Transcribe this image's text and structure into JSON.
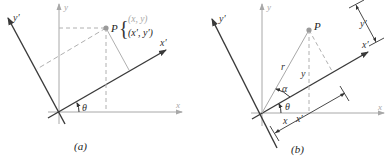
{
  "figure_a": {
    "caption": "(a)",
    "axis_x": "x",
    "axis_y": "y",
    "axis_x_prime": "x′",
    "axis_y_prime": "y′",
    "angle": "θ",
    "point": "P",
    "coord_xy": "(x, y)",
    "coord_xy_prime": "(x′, y′)"
  },
  "figure_b": {
    "caption": "(b)",
    "axis_x": "x",
    "axis_y": "y",
    "axis_x_prime": "x′",
    "axis_y_prime": "y′",
    "angle_theta": "θ",
    "angle_alpha": "α",
    "point": "P",
    "radius": "r",
    "len_x": "x",
    "len_y": "y",
    "len_x_prime": "x′",
    "len_y_prime": "y′"
  },
  "colors": {
    "axis_gray": "#a8a8a8",
    "rotated_axis": "#3a3a3a",
    "dashed": "#b0b0b0",
    "point": "#9a9a9a",
    "light_text": "#9a9a9a",
    "dark_text": "#222222"
  }
}
